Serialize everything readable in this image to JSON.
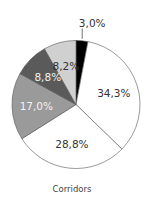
{
  "chart_data": {
    "type": "pie",
    "title": "",
    "caption": "Corridors",
    "start_angle_deg": 0,
    "direction": "clockwise",
    "slices": [
      {
        "label": "3,0%",
        "value": 3.0,
        "color": "#000000",
        "label_color": "#333333",
        "label_outside": true
      },
      {
        "label": "34,3%",
        "value": 34.3,
        "color": "#ffffff",
        "label_color": "#333333"
      },
      {
        "label": "28,8%",
        "value": 28.8,
        "color": "#ffffff",
        "label_color": "#333333"
      },
      {
        "label": "17,0%",
        "value": 17.0,
        "color": "#9a9a9a",
        "label_color": "#f2f2f2"
      },
      {
        "label": "8,8%",
        "value": 8.8,
        "color": "#5a5a5a",
        "label_color": "#f2f2f2"
      },
      {
        "label": "8,2%",
        "value": 8.2,
        "color": "#d0d0d0",
        "label_color": "#333333"
      }
    ]
  }
}
